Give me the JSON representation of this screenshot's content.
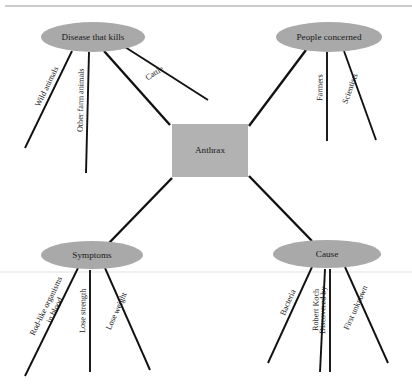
{
  "diagram": {
    "center": {
      "label": "Anthrax",
      "shape": "rectangle",
      "fill": "#b2b2b2",
      "x": 172,
      "y": 124,
      "width": 76,
      "height": 53
    },
    "node_fill": "#a9a9a9",
    "line_color": "#111111",
    "nodes": [
      {
        "id": "disease",
        "label": "Disease that kills",
        "cx": 93,
        "cy": 37,
        "rx": 52,
        "ry": 15,
        "branches": [
          {
            "label": "Wild animals",
            "x1": 72,
            "y1": 51,
            "x2": 25,
            "y2": 148,
            "rot": -64
          },
          {
            "label": "Other farm animals",
            "x1": 89,
            "y1": 52,
            "x2": 86,
            "y2": 173,
            "rot": -89
          },
          {
            "label": "",
            "x1": 104,
            "y1": 51,
            "x2": 170,
            "y2": 125,
            "rot": 0
          },
          {
            "label": "Cattle",
            "x1": 125,
            "y1": 47,
            "x2": 208,
            "y2": 100,
            "rot": -32
          }
        ]
      },
      {
        "id": "people",
        "label": "People concerned",
        "cx": 329,
        "cy": 37,
        "rx": 53,
        "ry": 15,
        "branches": [
          {
            "label": "",
            "x1": 306,
            "y1": 50,
            "x2": 249,
            "y2": 126,
            "rot": 0
          },
          {
            "label": "Farmers",
            "x1": 327,
            "y1": 52,
            "x2": 327,
            "y2": 141,
            "rot": -89
          },
          {
            "label": "Scientists",
            "x1": 344,
            "y1": 51,
            "x2": 376,
            "y2": 140,
            "rot": -70
          }
        ]
      },
      {
        "id": "symptoms",
        "label": "Symptoms",
        "cx": 92,
        "cy": 255,
        "rx": 51,
        "ry": 14,
        "branches": [
          {
            "label": "",
            "x1": 109,
            "y1": 243,
            "x2": 172,
            "y2": 178,
            "rot": 0
          },
          {
            "label": "Rod-like organisms|in blood",
            "x1": 78,
            "y1": 268,
            "x2": 25,
            "y2": 376,
            "rot": -64
          },
          {
            "label": "Lose strength",
            "x1": 90,
            "y1": 270,
            "x2": 90,
            "y2": 372,
            "rot": -89
          },
          {
            "label": "Lose weight",
            "x1": 105,
            "y1": 268,
            "x2": 150,
            "y2": 370,
            "rot": -66
          }
        ]
      },
      {
        "id": "cause",
        "label": "Cause",
        "cx": 327,
        "cy": 254,
        "rx": 54,
        "ry": 14,
        "branches": [
          {
            "label": "",
            "x1": 312,
            "y1": 241,
            "x2": 249,
            "y2": 176,
            "rot": 0
          },
          {
            "label": "Bacteria",
            "x1": 312,
            "y1": 267,
            "x2": 268,
            "y2": 363,
            "rot": -66
          },
          {
            "label": "Robert Koch",
            "x1": 325,
            "y1": 269,
            "x2": 320,
            "y2": 372,
            "rot": -89
          },
          {
            "label": "Discovered by",
            "x1": 330,
            "y1": 269,
            "x2": 330,
            "y2": 372,
            "rot": -89
          },
          {
            "label": "First unknown",
            "x1": 345,
            "y1": 267,
            "x2": 388,
            "y2": 363,
            "rot": -66
          }
        ]
      }
    ],
    "rules": [
      {
        "name": "top-rule",
        "x1": 5,
        "y1": 6,
        "x2": 412,
        "y2": 6
      },
      {
        "name": "middle-rule",
        "x1": 0,
        "y1": 272,
        "x2": 412,
        "y2": 272
      }
    ]
  }
}
